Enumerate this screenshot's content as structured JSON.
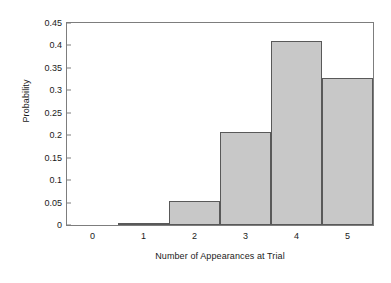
{
  "chart_data": {
    "type": "bar",
    "title": "",
    "xlabel": "Number of Appearances at Trial",
    "ylabel": "Probability",
    "categories": [
      "0",
      "1",
      "2",
      "3",
      "4",
      "5"
    ],
    "values": [
      0,
      0.004,
      0.054,
      0.207,
      0.409,
      0.327
    ],
    "ylim": [
      0,
      0.45
    ],
    "yticks": [
      "0",
      "0.05",
      "0.1",
      "0.15",
      "0.2",
      "0.25",
      "0.3",
      "0.35",
      "0.4",
      "0.45"
    ],
    "ytick_values": [
      0,
      0.05,
      0.1,
      0.15,
      0.2,
      0.25,
      0.3,
      0.35,
      0.4,
      0.45
    ],
    "xticks": [
      "0",
      "1",
      "2",
      "3",
      "4",
      "5"
    ],
    "grid": false,
    "legend": false,
    "bar_fill_color": "#c8c8c8",
    "bar_edge_color": "#595959",
    "axis_color": "#7d7d7d",
    "background_color": "#ffffff"
  }
}
